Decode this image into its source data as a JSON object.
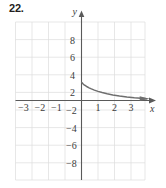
{
  "figure": {
    "problem_number": "22."
  },
  "axes": {
    "x_axis_name": "x",
    "y_axis_name": "y",
    "x_tick_labels": [
      "−3",
      "−2",
      "−1",
      "1",
      "2",
      "3"
    ],
    "y_tick_labels": [
      "8",
      "6",
      "4",
      "2",
      "−2",
      "−4",
      "−6",
      "−8"
    ]
  },
  "colors": {
    "grid": "#dcdcdc",
    "axis": "#5a5a5a",
    "curve": "#6e6e6e",
    "text": "#3c3c3c",
    "number_label": "#231f20",
    "background": "#ffffff"
  },
  "chart_data": {
    "type": "line",
    "title": "",
    "xlabel": "x",
    "ylabel": "y",
    "xlim": [
      -3.9,
      4.2
    ],
    "ylim": [
      -9.3,
      9.3
    ],
    "xticks": [
      -3,
      -2,
      -1,
      1,
      2,
      3
    ],
    "yticks": [
      8,
      6,
      4,
      2,
      -2,
      -4,
      -6,
      -8
    ],
    "grid": true,
    "legend": null,
    "series": [
      {
        "name": "decaying curve",
        "x": [
          0.02,
          0.05,
          0.1,
          0.16,
          0.24,
          0.34,
          0.46,
          0.6,
          0.78,
          1.0,
          1.25,
          1.55,
          1.9,
          2.3,
          2.75,
          3.2,
          3.6,
          3.95
        ],
        "y": [
          2.05,
          1.98,
          1.88,
          1.78,
          1.68,
          1.56,
          1.44,
          1.32,
          1.18,
          1.04,
          0.9,
          0.76,
          0.63,
          0.51,
          0.4,
          0.31,
          0.25,
          0.2
        ]
      }
    ]
  }
}
